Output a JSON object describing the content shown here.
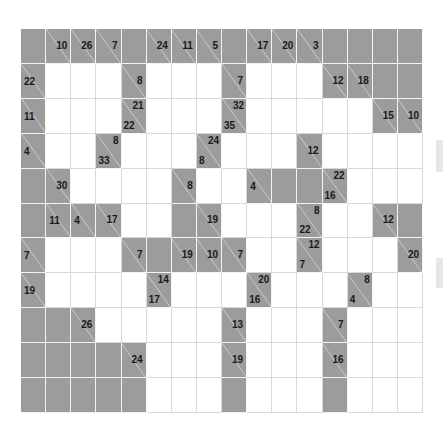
{
  "puzzle": {
    "type": "kakuro",
    "title": "Kakuro puzzle grid",
    "rows": 11,
    "cols": 16,
    "colors": {
      "clue_block": "#9c9c9c",
      "empty_cell": "#ffffff",
      "grid_line": "#d8d8d8",
      "slash_line": "#f0f0f0",
      "clue_text": "#1a1a1a"
    },
    "legend": {
      "down_label": "down clue (upper-right of block)",
      "across_label": "across clue (lower-left of block)"
    },
    "cells": [
      [
        {
          "t": "g"
        },
        {
          "t": "c",
          "d": "10"
        },
        {
          "t": "c",
          "d": "26"
        },
        {
          "t": "c",
          "d": "7"
        },
        {
          "t": "g"
        },
        {
          "t": "c",
          "d": "24"
        },
        {
          "t": "c",
          "d": "11"
        },
        {
          "t": "c",
          "d": "5"
        },
        {
          "t": "g"
        },
        {
          "t": "c",
          "d": "17"
        },
        {
          "t": "c",
          "d": "20"
        },
        {
          "t": "c",
          "d": "3"
        },
        {
          "t": "g"
        },
        {
          "t": "g"
        },
        {
          "t": "g"
        },
        {
          "t": "g"
        }
      ],
      [
        {
          "t": "c",
          "a": "22"
        },
        {
          "t": "w"
        },
        {
          "t": "w"
        },
        {
          "t": "w"
        },
        {
          "t": "c",
          "d": "8"
        },
        {
          "t": "w"
        },
        {
          "t": "w"
        },
        {
          "t": "w"
        },
        {
          "t": "c",
          "d": "7"
        },
        {
          "t": "w"
        },
        {
          "t": "w"
        },
        {
          "t": "w"
        },
        {
          "t": "c",
          "d": "12"
        },
        {
          "t": "c",
          "d": "18"
        },
        {
          "t": "g"
        },
        {
          "t": "g"
        }
      ],
      [
        {
          "t": "c",
          "a": "11"
        },
        {
          "t": "w"
        },
        {
          "t": "w"
        },
        {
          "t": "w"
        },
        {
          "t": "c",
          "d": "21",
          "a": "22"
        },
        {
          "t": "w"
        },
        {
          "t": "w"
        },
        {
          "t": "w"
        },
        {
          "t": "c",
          "d": "32",
          "a": "35"
        },
        {
          "t": "w"
        },
        {
          "t": "w"
        },
        {
          "t": "w"
        },
        {
          "t": "w"
        },
        {
          "t": "w"
        },
        {
          "t": "c",
          "d": "15"
        },
        {
          "t": "c",
          "d": "10"
        }
      ],
      [
        {
          "t": "c",
          "a": "4"
        },
        {
          "t": "w"
        },
        {
          "t": "w"
        },
        {
          "t": "c",
          "d": "8",
          "a": "33"
        },
        {
          "t": "w"
        },
        {
          "t": "w"
        },
        {
          "t": "w"
        },
        {
          "t": "c",
          "d": "24",
          "a": "8"
        },
        {
          "t": "w"
        },
        {
          "t": "w"
        },
        {
          "t": "w"
        },
        {
          "t": "c",
          "d": "12"
        },
        {
          "t": "w"
        },
        {
          "t": "w"
        },
        {
          "t": "w"
        },
        {
          "t": "w"
        }
      ],
      [
        {
          "t": "g"
        },
        {
          "t": "c",
          "d": "30"
        },
        {
          "t": "w"
        },
        {
          "t": "w"
        },
        {
          "t": "w"
        },
        {
          "t": "w"
        },
        {
          "t": "c",
          "d": "8"
        },
        {
          "t": "w"
        },
        {
          "t": "w"
        },
        {
          "t": "c",
          "a": "4"
        },
        {
          "t": "g"
        },
        {
          "t": "g"
        },
        {
          "t": "c",
          "d": "22",
          "a": "16"
        },
        {
          "t": "w"
        },
        {
          "t": "w"
        },
        {
          "t": "w"
        }
      ],
      [
        {
          "t": "g"
        },
        {
          "t": "c",
          "a": "11"
        },
        {
          "t": "c",
          "a": "4"
        },
        {
          "t": "c",
          "d": "17"
        },
        {
          "t": "w"
        },
        {
          "t": "w"
        },
        {
          "t": "g"
        },
        {
          "t": "c",
          "d": "19"
        },
        {
          "t": "w"
        },
        {
          "t": "w"
        },
        {
          "t": "w"
        },
        {
          "t": "c",
          "d": "8",
          "a": "22"
        },
        {
          "t": "w"
        },
        {
          "t": "w"
        },
        {
          "t": "c",
          "d": "12"
        },
        {
          "t": "g"
        }
      ],
      [
        {
          "t": "c",
          "a": "7"
        },
        {
          "t": "w"
        },
        {
          "t": "w"
        },
        {
          "t": "w"
        },
        {
          "t": "c",
          "d": "7"
        },
        {
          "t": "g"
        },
        {
          "t": "c",
          "d": "19"
        },
        {
          "t": "c",
          "d": "10"
        },
        {
          "t": "c",
          "d": "7"
        },
        {
          "t": "w"
        },
        {
          "t": "w"
        },
        {
          "t": "c",
          "d": "12",
          "a": "7"
        },
        {
          "t": "w"
        },
        {
          "t": "w"
        },
        {
          "t": "w"
        },
        {
          "t": "c",
          "d": "20"
        }
      ],
      [
        {
          "t": "c",
          "a": "19"
        },
        {
          "t": "w"
        },
        {
          "t": "w"
        },
        {
          "t": "w"
        },
        {
          "t": "w"
        },
        {
          "t": "c",
          "d": "14",
          "a": "17"
        },
        {
          "t": "w"
        },
        {
          "t": "w"
        },
        {
          "t": "w"
        },
        {
          "t": "c",
          "d": "20",
          "a": "16"
        },
        {
          "t": "w"
        },
        {
          "t": "w"
        },
        {
          "t": "w"
        },
        {
          "t": "c",
          "d": "8",
          "a": "4"
        },
        {
          "t": "w"
        },
        {
          "t": "w"
        }
      ],
      [
        {
          "t": "g"
        },
        {
          "t": "g"
        },
        {
          "t": "c",
          "d": "26"
        },
        {
          "t": "w"
        },
        {
          "t": "w"
        },
        {
          "t": "w"
        },
        {
          "t": "w"
        },
        {
          "t": "w"
        },
        {
          "t": "c",
          "d": "13"
        },
        {
          "t": "w"
        },
        {
          "t": "w"
        },
        {
          "t": "w"
        },
        {
          "t": "c",
          "d": "7"
        },
        {
          "t": "w"
        },
        {
          "t": "w"
        },
        {
          "t": "w"
        }
      ],
      [
        {
          "t": "g"
        },
        {
          "t": "g"
        },
        {
          "t": "g"
        },
        {
          "t": "g"
        },
        {
          "t": "c",
          "d": "24"
        },
        {
          "t": "w"
        },
        {
          "t": "w"
        },
        {
          "t": "w"
        },
        {
          "t": "c",
          "d": "19"
        },
        {
          "t": "w"
        },
        {
          "t": "w"
        },
        {
          "t": "w"
        },
        {
          "t": "c",
          "d": "16"
        },
        {
          "t": "w"
        },
        {
          "t": "w"
        },
        {
          "t": "w"
        }
      ],
      [
        {
          "t": "g"
        },
        {
          "t": "g"
        },
        {
          "t": "g"
        },
        {
          "t": "g"
        },
        {
          "t": "g"
        },
        {
          "t": "w"
        },
        {
          "t": "w"
        },
        {
          "t": "w"
        },
        {
          "t": "g"
        },
        {
          "t": "w"
        },
        {
          "t": "w"
        },
        {
          "t": "w"
        },
        {
          "t": "g"
        },
        {
          "t": "w"
        },
        {
          "t": "w"
        },
        {
          "t": "w"
        }
      ]
    ]
  }
}
